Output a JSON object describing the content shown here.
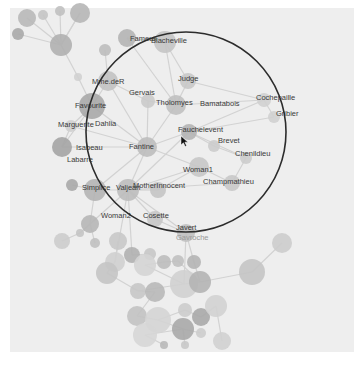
{
  "canvas": {
    "x": 10,
    "y": 8,
    "width": 344,
    "height": 344,
    "background": "#eeeeee"
  },
  "colors": {
    "edge": "#d2d2d2",
    "lens_stroke": "#2c2c2c",
    "label": "#3a3a3a"
  },
  "lens": {
    "cx": 186,
    "cy": 132,
    "r": 100
  },
  "cursor": {
    "x": 181,
    "y": 136
  },
  "labels": [
    {
      "text": "Fameuil",
      "x": 130,
      "y": 41
    },
    {
      "text": "Blacheville",
      "x": 151,
      "y": 43
    },
    {
      "text": "Mme.deR",
      "x": 92,
      "y": 84
    },
    {
      "text": "Judge",
      "x": 178,
      "y": 81
    },
    {
      "text": "Gervais",
      "x": 129,
      "y": 95
    },
    {
      "text": "Cochepaille",
      "x": 256,
      "y": 100
    },
    {
      "text": "Tholomyes",
      "x": 156,
      "y": 105
    },
    {
      "text": "Bamatabois",
      "x": 200,
      "y": 106
    },
    {
      "text": "Favourite",
      "x": 75,
      "y": 108
    },
    {
      "text": "Gribier",
      "x": 276,
      "y": 116
    },
    {
      "text": "Marguerite",
      "x": 58,
      "y": 127
    },
    {
      "text": "Dahlia",
      "x": 95,
      "y": 126
    },
    {
      "text": "Fauchelevent",
      "x": 178,
      "y": 132
    },
    {
      "text": "Brevet",
      "x": 218,
      "y": 143
    },
    {
      "text": "Fantine",
      "x": 129,
      "y": 149
    },
    {
      "text": "Isabeau",
      "x": 76,
      "y": 150
    },
    {
      "text": "Chenildieu",
      "x": 235,
      "y": 156
    },
    {
      "text": "Labarre",
      "x": 67,
      "y": 162
    },
    {
      "text": "Woman1",
      "x": 183,
      "y": 172
    },
    {
      "text": "Champmathieu",
      "x": 203,
      "y": 184
    },
    {
      "text": "Simplice",
      "x": 82,
      "y": 190
    },
    {
      "text": "Valjean",
      "x": 116,
      "y": 190
    },
    {
      "text": "MotherInnocent",
      "x": 133,
      "y": 188
    },
    {
      "text": "Woman2",
      "x": 101,
      "y": 218
    },
    {
      "text": "Cosette",
      "x": 143,
      "y": 218
    },
    {
      "text": "Javert",
      "x": 176,
      "y": 230
    },
    {
      "text": "Gavroche",
      "x": 176,
      "y": 240,
      "faint": true
    }
  ],
  "nodes": [
    {
      "x": 27,
      "y": 18,
      "r": 9,
      "c": "#b8b8b8"
    },
    {
      "x": 43,
      "y": 15,
      "r": 5,
      "c": "#c4c4c4"
    },
    {
      "x": 60,
      "y": 11,
      "r": 5,
      "c": "#c0c0c0"
    },
    {
      "x": 80,
      "y": 13,
      "r": 10,
      "c": "#b6b6b6"
    },
    {
      "x": 18,
      "y": 34,
      "r": 6,
      "c": "#a8a8a8"
    },
    {
      "x": 61,
      "y": 45,
      "r": 11,
      "c": "#b0b0b0"
    },
    {
      "x": 105,
      "y": 50,
      "r": 6,
      "c": "#bcbcbc"
    },
    {
      "x": 127,
      "y": 38,
      "r": 9,
      "c": "#b4b4b4"
    },
    {
      "x": 165,
      "y": 42,
      "r": 11,
      "c": "#c4c4c4"
    },
    {
      "x": 78,
      "y": 77,
      "r": 4,
      "c": "#d0d0d0"
    },
    {
      "x": 108,
      "y": 81,
      "r": 10,
      "c": "#c2c2c2"
    },
    {
      "x": 188,
      "y": 81,
      "r": 8,
      "c": "#c8c8c8"
    },
    {
      "x": 148,
      "y": 101,
      "r": 7,
      "c": "#cacaca"
    },
    {
      "x": 176,
      "y": 105,
      "r": 10,
      "c": "#c0c0c0"
    },
    {
      "x": 264,
      "y": 100,
      "r": 7,
      "c": "#d0d0d0"
    },
    {
      "x": 274,
      "y": 117,
      "r": 6,
      "c": "#d0d0d0"
    },
    {
      "x": 92,
      "y": 106,
      "r": 13,
      "c": "#a8a8a8"
    },
    {
      "x": 71,
      "y": 126,
      "r": 6,
      "c": "#cfcfcf"
    },
    {
      "x": 62,
      "y": 147,
      "r": 10,
      "c": "#a4a4a4"
    },
    {
      "x": 147,
      "y": 147,
      "r": 10,
      "c": "#bcbcbc"
    },
    {
      "x": 189,
      "y": 132,
      "r": 8,
      "c": "#b4b4b4"
    },
    {
      "x": 214,
      "y": 146,
      "r": 6,
      "c": "#cccccc"
    },
    {
      "x": 246,
      "y": 158,
      "r": 6,
      "c": "#cccccc"
    },
    {
      "x": 199,
      "y": 167,
      "r": 10,
      "c": "#c6c6c6"
    },
    {
      "x": 232,
      "y": 183,
      "r": 8,
      "c": "#c8c8c8"
    },
    {
      "x": 72,
      "y": 185,
      "r": 6,
      "c": "#a8a8a8"
    },
    {
      "x": 95,
      "y": 190,
      "r": 11,
      "c": "#b4b4b4"
    },
    {
      "x": 128,
      "y": 190,
      "r": 11,
      "c": "#bcbcbc"
    },
    {
      "x": 158,
      "y": 190,
      "r": 8,
      "c": "#c4c4c4"
    },
    {
      "x": 90,
      "y": 224,
      "r": 9,
      "c": "#b6b6b6"
    },
    {
      "x": 155,
      "y": 219,
      "r": 8,
      "c": "#c6c6c6"
    },
    {
      "x": 186,
      "y": 233,
      "r": 9,
      "c": "#c0c0c0"
    },
    {
      "x": 62,
      "y": 241,
      "r": 8,
      "c": "#cccccc"
    },
    {
      "x": 80,
      "y": 233,
      "r": 4,
      "c": "#c4c4c4"
    },
    {
      "x": 95,
      "y": 243,
      "r": 5,
      "c": "#c0c0c0"
    },
    {
      "x": 118,
      "y": 241,
      "r": 9,
      "c": "#c8c8c8"
    },
    {
      "x": 132,
      "y": 255,
      "r": 8,
      "c": "#b0b0b0"
    },
    {
      "x": 150,
      "y": 254,
      "r": 6,
      "c": "#c6c6c6"
    },
    {
      "x": 115,
      "y": 262,
      "r": 10,
      "c": "#cfcfcf"
    },
    {
      "x": 107,
      "y": 273,
      "r": 11,
      "c": "#c4c4c4"
    },
    {
      "x": 145,
      "y": 265,
      "r": 11,
      "c": "#d4d4d4"
    },
    {
      "x": 164,
      "y": 262,
      "r": 7,
      "c": "#bcbcbc"
    },
    {
      "x": 178,
      "y": 261,
      "r": 6,
      "c": "#c0c0c0"
    },
    {
      "x": 194,
      "y": 262,
      "r": 7,
      "c": "#b4b4b4"
    },
    {
      "x": 184,
      "y": 284,
      "r": 14,
      "c": "#d0d0d0"
    },
    {
      "x": 200,
      "y": 282,
      "r": 11,
      "c": "#b4b4b4"
    },
    {
      "x": 138,
      "y": 291,
      "r": 8,
      "c": "#c6c6c6"
    },
    {
      "x": 155,
      "y": 292,
      "r": 10,
      "c": "#b8b8b8"
    },
    {
      "x": 252,
      "y": 272,
      "r": 13,
      "c": "#c4c4c4"
    },
    {
      "x": 282,
      "y": 243,
      "r": 10,
      "c": "#cccccc"
    },
    {
      "x": 137,
      "y": 316,
      "r": 10,
      "c": "#c2c2c2"
    },
    {
      "x": 158,
      "y": 320,
      "r": 13,
      "c": "#d4d4d4"
    },
    {
      "x": 185,
      "y": 310,
      "r": 7,
      "c": "#cccccc"
    },
    {
      "x": 201,
      "y": 317,
      "r": 9,
      "c": "#a8a8a8"
    },
    {
      "x": 216,
      "y": 306,
      "r": 11,
      "c": "#d2d2d2"
    },
    {
      "x": 183,
      "y": 329,
      "r": 11,
      "c": "#a8a8a8"
    },
    {
      "x": 145,
      "y": 335,
      "r": 12,
      "c": "#d6d6d6"
    },
    {
      "x": 201,
      "y": 333,
      "r": 5,
      "c": "#cccccc"
    },
    {
      "x": 222,
      "y": 341,
      "r": 9,
      "c": "#d0d0d0"
    },
    {
      "x": 164,
      "y": 345,
      "r": 4,
      "c": "#b8b8b8"
    },
    {
      "x": 185,
      "y": 345,
      "r": 4,
      "c": "#c8c8c8"
    }
  ],
  "edges": [
    [
      5,
      0
    ],
    [
      5,
      1
    ],
    [
      5,
      2
    ],
    [
      5,
      3
    ],
    [
      5,
      4
    ],
    [
      5,
      9
    ],
    [
      9,
      16
    ],
    [
      16,
      10
    ],
    [
      16,
      17
    ],
    [
      16,
      18
    ],
    [
      16,
      19
    ],
    [
      19,
      13
    ],
    [
      19,
      12
    ],
    [
      19,
      10
    ],
    [
      19,
      17
    ],
    [
      19,
      18
    ],
    [
      19,
      20
    ],
    [
      19,
      23
    ],
    [
      19,
      27
    ],
    [
      19,
      26
    ],
    [
      13,
      11
    ],
    [
      13,
      12
    ],
    [
      13,
      14
    ],
    [
      13,
      8
    ],
    [
      13,
      7
    ],
    [
      12,
      10
    ],
    [
      8,
      11
    ],
    [
      20,
      21
    ],
    [
      20,
      22
    ],
    [
      20,
      14
    ],
    [
      20,
      15
    ],
    [
      20,
      27
    ],
    [
      27,
      26
    ],
    [
      27,
      28
    ],
    [
      27,
      23
    ],
    [
      27,
      24
    ],
    [
      27,
      30
    ],
    [
      27,
      31
    ],
    [
      27,
      29
    ],
    [
      27,
      36
    ],
    [
      27,
      38
    ],
    [
      26,
      25
    ],
    [
      26,
      29
    ],
    [
      28,
      23
    ],
    [
      30,
      31
    ],
    [
      31,
      43
    ],
    [
      31,
      44
    ],
    [
      29,
      33
    ],
    [
      29,
      34
    ],
    [
      32,
      33
    ],
    [
      35,
      38
    ],
    [
      36,
      37
    ],
    [
      38,
      39
    ],
    [
      40,
      44
    ],
    [
      41,
      42
    ],
    [
      43,
      45
    ],
    [
      44,
      45
    ],
    [
      45,
      48
    ],
    [
      48,
      49
    ],
    [
      44,
      46
    ],
    [
      46,
      47
    ],
    [
      47,
      50
    ],
    [
      50,
      51
    ],
    [
      51,
      52
    ],
    [
      52,
      53
    ],
    [
      53,
      54
    ],
    [
      51,
      55
    ],
    [
      55,
      56
    ],
    [
      55,
      57
    ],
    [
      54,
      58
    ],
    [
      56,
      59
    ],
    [
      55,
      60
    ],
    [
      39,
      46
    ],
    [
      40,
      41
    ],
    [
      42,
      45
    ],
    [
      23,
      24
    ],
    [
      22,
      24
    ],
    [
      14,
      15
    ],
    [
      21,
      22
    ],
    [
      11,
      14
    ],
    [
      6,
      10
    ],
    [
      7,
      8
    ],
    [
      3,
      5
    ],
    [
      17,
      18
    ]
  ]
}
